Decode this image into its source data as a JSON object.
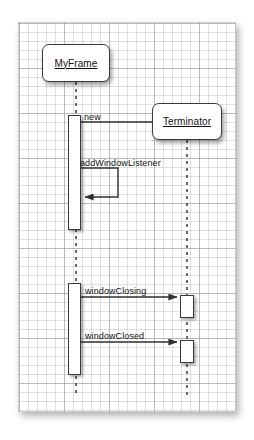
{
  "diagram": {
    "kind": "uml-sequence-diagram",
    "background": {
      "paper_color": "#ffffff",
      "grid_color": "#969ba0",
      "grid_major_color": "#787e84",
      "grid_minor_spacing_px": 9,
      "grid_major_spacing_px": 45
    },
    "stroke_color": "#3a3a3a",
    "text_color": "#111111",
    "participants": [
      {
        "id": "myframe",
        "label": "MyFrame",
        "underlined": true,
        "box": {
          "x": 42,
          "y": 44,
          "w": 68,
          "h": 38
        },
        "lifeline_x": 76,
        "lifeline_top": 82,
        "lifeline_bottom": 396
      },
      {
        "id": "terminator",
        "label": "Terminator",
        "underlined": true,
        "box": {
          "x": 152,
          "y": 103,
          "w": 70,
          "h": 37
        },
        "lifeline_x": 187,
        "lifeline_top": 140,
        "lifeline_bottom": 396
      }
    ],
    "activations": [
      {
        "id": "act-myframe-1",
        "owner": "myframe",
        "x": 68,
        "y": 115,
        "w": 13,
        "h": 115
      },
      {
        "id": "act-myframe-2",
        "owner": "myframe",
        "x": 68,
        "y": 283,
        "w": 13,
        "h": 92
      },
      {
        "id": "act-terminator-1",
        "owner": "terminator",
        "x": 180,
        "y": 295,
        "w": 14,
        "h": 23
      },
      {
        "id": "act-terminator-2",
        "owner": "terminator",
        "x": 180,
        "y": 340,
        "w": 14,
        "h": 23
      }
    ],
    "messages": [
      {
        "id": "msg-new",
        "label": "new",
        "from": "myframe",
        "to": "terminator",
        "type": "call",
        "self": false,
        "y": 122,
        "x_start": 81,
        "x_end": 178,
        "label_x": 84,
        "label_y": 112
      },
      {
        "id": "msg-addwindowlistener",
        "label": "addWindowListener",
        "from": "myframe",
        "to": "myframe",
        "type": "self-call",
        "self": true,
        "y_out": 168,
        "y_back": 197,
        "x_start": 81,
        "x_turn": 118,
        "label_x": 80,
        "label_y": 159
      },
      {
        "id": "msg-windowclosing",
        "label": "windowClosing",
        "from": "myframe",
        "to": "terminator",
        "type": "call",
        "self": false,
        "y": 297,
        "x_start": 81,
        "x_end": 178,
        "label_x": 85,
        "label_y": 287
      },
      {
        "id": "msg-windowclosed",
        "label": "windowClosed",
        "from": "myframe",
        "to": "terminator",
        "type": "call",
        "self": false,
        "y": 342,
        "x_start": 81,
        "x_end": 178,
        "label_x": 85,
        "label_y": 332
      }
    ]
  }
}
